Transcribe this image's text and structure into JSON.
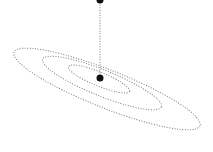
{
  "diagram": {
    "type": "orbit-projection",
    "colors": {
      "background": "#ffffff",
      "dotted_line": "#7a7a7a",
      "point": "#111111"
    },
    "orbits": [
      {
        "name": "outer",
        "cx": 107,
        "cy": 89,
        "rx": 100,
        "ry": 19,
        "rotate": 21.6
      },
      {
        "name": "middle",
        "cx": 102,
        "cy": 83,
        "rx": 64,
        "ry": 13,
        "rotate": 22
      },
      {
        "name": "inner",
        "cx": 99,
        "cy": 79,
        "rx": 33,
        "ry": 7,
        "rotate": 22
      }
    ],
    "center_point": {
      "x": 100,
      "y": 78,
      "r": 3.5
    },
    "top_point": {
      "x": 100,
      "y": 0,
      "r": 3.5
    },
    "vertical_line": {
      "x": 100,
      "y1": 2,
      "y2": 75
    }
  }
}
